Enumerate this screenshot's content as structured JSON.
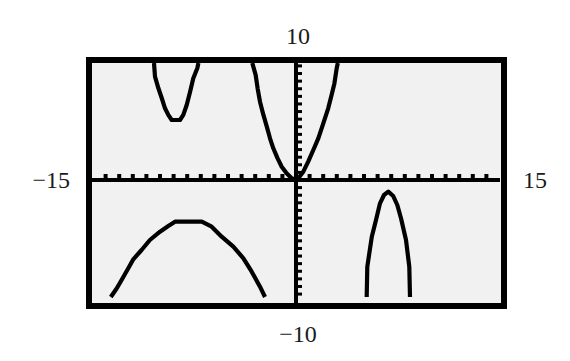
{
  "colors": {
    "page_bg": "#ffffff",
    "screen_bg": "#f1f1f1",
    "frame": "#000000",
    "axes": "#000000",
    "curve": "#000000",
    "label_text": "#1a1a1a"
  },
  "chart_data": {
    "type": "line",
    "title": "",
    "xlabel": "",
    "ylabel": "",
    "xlim": [
      -15,
      15
    ],
    "ylim": [
      -10,
      10
    ],
    "grid": false,
    "legend": null,
    "x_tick_step": 1,
    "y_tick_step": 0.65,
    "window_labels": {
      "ymax": "10",
      "ymin": "−10",
      "xmin": "−15",
      "xmax": "15"
    },
    "series": [
      {
        "points": [
          [
            -10.44,
            10
          ],
          [
            -10.37,
            8.83
          ],
          [
            -10.12,
            7.84
          ],
          [
            -9.87,
            6.98
          ],
          [
            -9.63,
            6.13
          ],
          [
            -9.39,
            5.56
          ],
          [
            -9.14,
            5.13
          ],
          [
            -8.53,
            5.13
          ],
          [
            -8.29,
            5.56
          ],
          [
            -8.04,
            6.41
          ],
          [
            -7.79,
            7.55
          ],
          [
            -7.55,
            8.69
          ],
          [
            -7.26,
            9.55
          ],
          [
            -7.18,
            10
          ]
        ]
      },
      {
        "points": [
          [
            -3.21,
            10
          ],
          [
            -2.96,
            8.97
          ],
          [
            -2.82,
            7.84
          ],
          [
            -2.65,
            6.69
          ],
          [
            -2.4,
            5.56
          ],
          [
            -2.15,
            4.56
          ],
          [
            -1.91,
            3.56
          ],
          [
            -1.67,
            2.71
          ],
          [
            -1.35,
            1.85
          ],
          [
            -1.05,
            1.14
          ],
          [
            -0.69,
            0.57
          ],
          [
            -0.32,
            0.15
          ],
          [
            0,
            0
          ],
          [
            0.17,
            0.15
          ],
          [
            0.54,
            0.71
          ],
          [
            0.9,
            1.56
          ],
          [
            1.27,
            2.56
          ],
          [
            1.64,
            3.56
          ],
          [
            2.01,
            4.85
          ],
          [
            2.37,
            6.13
          ],
          [
            2.62,
            7.26
          ],
          [
            2.82,
            8.26
          ],
          [
            2.99,
            9.55
          ],
          [
            3.07,
            10
          ]
        ]
      },
      {
        "points": [
          [
            -13.62,
            -10
          ],
          [
            -13.18,
            -9.26
          ],
          [
            -12.82,
            -8.55
          ],
          [
            -12.33,
            -7.55
          ],
          [
            -11.96,
            -6.78
          ],
          [
            -11.35,
            -5.98
          ],
          [
            -10.74,
            -5.13
          ],
          [
            -10.0,
            -4.42
          ],
          [
            -9.39,
            -3.93
          ],
          [
            -8.9,
            -3.56
          ],
          [
            -6.93,
            -3.56
          ],
          [
            -6.2,
            -3.99
          ],
          [
            -5.46,
            -4.85
          ],
          [
            -4.61,
            -5.7
          ],
          [
            -3.87,
            -6.69
          ],
          [
            -3.26,
            -7.84
          ],
          [
            -2.65,
            -9.12
          ],
          [
            -2.28,
            -10
          ]
        ]
      },
      {
        "points": [
          [
            5.2,
            -10
          ],
          [
            5.24,
            -7.41
          ],
          [
            5.57,
            -4.85
          ],
          [
            5.88,
            -3.42
          ],
          [
            6.18,
            -1.99
          ],
          [
            6.47,
            -1.28
          ],
          [
            6.79,
            -1.0
          ],
          [
            7.15,
            -1.37
          ],
          [
            7.45,
            -2.14
          ],
          [
            7.72,
            -3.27
          ],
          [
            8.09,
            -5.13
          ],
          [
            8.33,
            -7.41
          ],
          [
            8.38,
            -10
          ]
        ]
      }
    ]
  }
}
